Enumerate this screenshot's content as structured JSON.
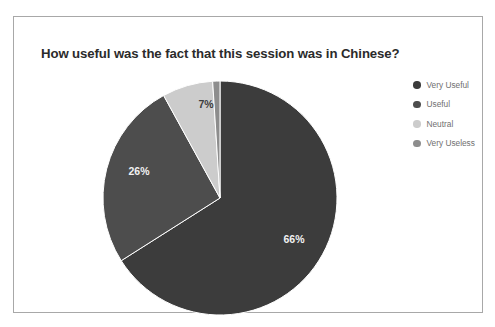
{
  "frame": {
    "border_color": "#a8a8a8",
    "background": "#ffffff"
  },
  "chart_data": {
    "type": "pie",
    "title": "How useful was the fact that this session was in Chinese?",
    "categories": [
      "Very Useful",
      "Useful",
      "Neutral",
      "Very Useless"
    ],
    "values": [
      66,
      26,
      7,
      1
    ],
    "value_labels": [
      "66%",
      "26%",
      "7%",
      ""
    ],
    "colors": [
      "#3c3c3c",
      "#4d4d4d",
      "#cccccc",
      "#8d8d8d"
    ],
    "label_colors": [
      "#f2f2f2",
      "#f2f2f2",
      "#3d3d3d",
      "#3d3d3d"
    ],
    "legend_position": "right",
    "start_angle_deg": 0,
    "direction": "clockwise",
    "grid": false,
    "xlabel": "",
    "ylabel": ""
  },
  "legend": {
    "items": [
      {
        "label": "Very Useful",
        "color": "#3c3c3c"
      },
      {
        "label": "Useful",
        "color": "#4d4d4d"
      },
      {
        "label": "Neutral",
        "color": "#cccccc"
      },
      {
        "label": "Very Useless",
        "color": "#8d8d8d"
      }
    ]
  },
  "slice_labels": {
    "very_useful": "66%",
    "useful": "26%",
    "neutral": "7%"
  }
}
